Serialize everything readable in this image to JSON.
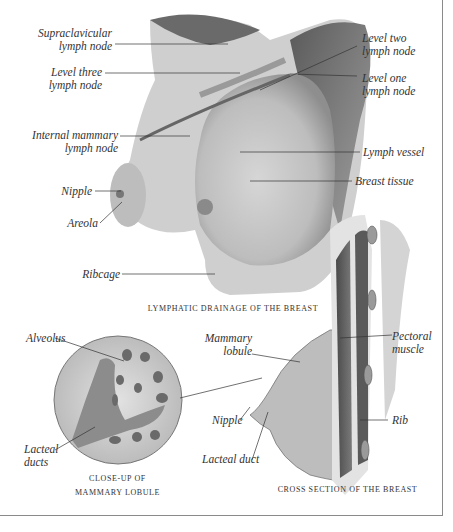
{
  "figure": {
    "top": {
      "caption": "Lymphatic drainage of the breast",
      "labels": {
        "supraclavicular": [
          "Supraclavicular",
          "lymph node"
        ],
        "level_three": [
          "Level three",
          "lymph node"
        ],
        "internal_mammary": [
          "Internal mammary",
          "lymph node"
        ],
        "nipple": "Nipple",
        "areola": "Areola",
        "ribcage": "Ribcage",
        "level_two": [
          "Level two",
          "lymph node"
        ],
        "level_one": [
          "Level one",
          "lymph node"
        ],
        "lymph_vessel": "Lymph vessel",
        "breast_tissue": "Breast tissue"
      }
    },
    "closeup": {
      "caption_line1": "Close-up of",
      "caption_line2": "Mammary lobule",
      "labels": {
        "alveolus": "Alveolus",
        "lacteal_ducts": [
          "Lacteal",
          "ducts"
        ]
      }
    },
    "cross_section": {
      "caption": "Cross section of the breast",
      "labels": {
        "mammary_lobule": [
          "Mammary",
          "lobule"
        ],
        "pectoral_muscle": [
          "Pectoral",
          "muscle"
        ],
        "nipple": "Nipple",
        "lacteal_duct": "Lacteal duct",
        "rib": "Rib"
      }
    }
  }
}
